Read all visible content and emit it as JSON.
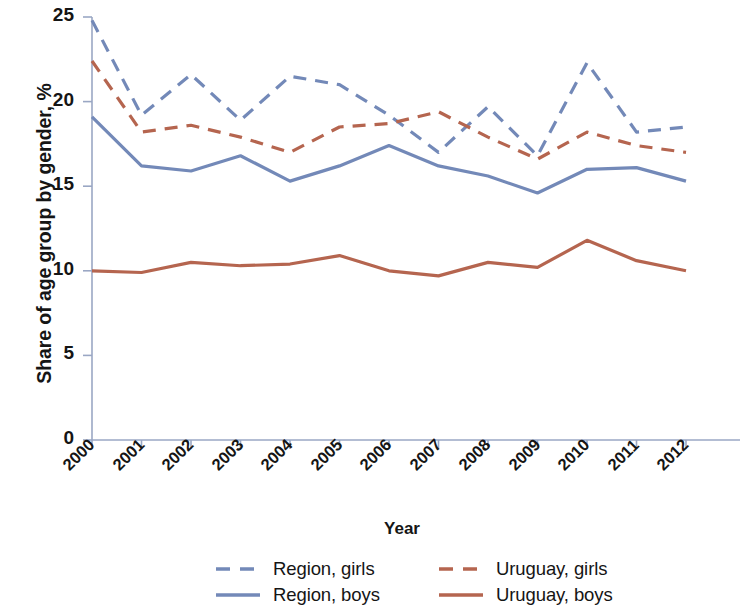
{
  "chart_data": {
    "type": "line",
    "title": "",
    "xlabel": "Year",
    "ylabel": "Share of age group by gender, %",
    "categories": [
      "2000",
      "2001",
      "2002",
      "2003",
      "2004",
      "2005",
      "2006",
      "2007",
      "2008",
      "2009",
      "2010",
      "2011",
      "2012"
    ],
    "x": [
      2000,
      2001,
      2002,
      2003,
      2004,
      2005,
      2006,
      2007,
      2008,
      2009,
      2010,
      2011,
      2012
    ],
    "ylim": [
      0,
      25
    ],
    "yticks": [
      0,
      5,
      10,
      15,
      20,
      25
    ],
    "grid": false,
    "legend_position": "bottom",
    "series": [
      {
        "name": "Region, girls",
        "color": "#7389b8",
        "style": "dashed",
        "values": [
          24.8,
          19.2,
          21.6,
          18.9,
          21.5,
          21.0,
          19.2,
          17.0,
          19.7,
          16.8,
          22.3,
          18.2,
          18.5
        ]
      },
      {
        "name": "Region, boys",
        "color": "#7389b8",
        "style": "solid",
        "values": [
          19.1,
          16.2,
          15.9,
          16.8,
          15.3,
          16.2,
          17.4,
          16.2,
          15.6,
          14.6,
          16.0,
          16.1,
          15.3
        ]
      },
      {
        "name": "Uruguay, girls",
        "color": "#b5654f",
        "style": "dashed",
        "values": [
          22.4,
          18.2,
          18.6,
          17.9,
          17.0,
          18.5,
          18.7,
          19.4,
          17.9,
          16.6,
          18.2,
          17.4,
          17.0
        ]
      },
      {
        "name": "Uruguay, boys",
        "color": "#b5654f",
        "style": "solid",
        "values": [
          10.0,
          9.9,
          10.5,
          10.3,
          10.4,
          10.9,
          10.0,
          9.7,
          10.5,
          10.2,
          11.8,
          10.6,
          10.0
        ]
      }
    ]
  },
  "axes": {
    "y_title": "Share of age group by gender, %",
    "x_title": "Year",
    "y_tick_labels": [
      "25",
      "20",
      "15",
      "10",
      "5",
      "0"
    ],
    "x_tick_labels": [
      "2000",
      "2001",
      "2002",
      "2003",
      "2004",
      "2005",
      "2006",
      "2007",
      "2008",
      "2009",
      "2010",
      "2011",
      "2012"
    ]
  },
  "legend": {
    "items": [
      {
        "label": "Region, girls",
        "color": "#7389b8",
        "style": "dashed"
      },
      {
        "label": "Uruguay, girls",
        "color": "#b5654f",
        "style": "dashed"
      },
      {
        "label": "Region, boys",
        "color": "#7389b8",
        "style": "solid"
      },
      {
        "label": "Uruguay, boys",
        "color": "#b5654f",
        "style": "solid"
      }
    ]
  },
  "colors": {
    "region": "#7389b8",
    "uruguay": "#b5654f",
    "axis": "#9aa7c4",
    "text": "#151515"
  }
}
